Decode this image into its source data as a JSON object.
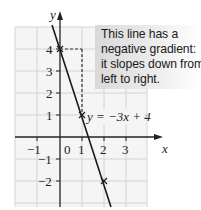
{
  "diagram": {
    "axes": {
      "x_label": "x",
      "y_label": "y",
      "x_ticks": [
        "−1",
        "0",
        "1",
        "2",
        "3"
      ],
      "y_ticks": [
        "4",
        "3",
        "2",
        "1",
        "−1",
        "−2"
      ]
    },
    "line_label": "y = −3x + 4",
    "points": [
      {
        "x": 0,
        "y": 4,
        "marker": "cross"
      },
      {
        "x": 1,
        "y": 1,
        "marker": "cross"
      },
      {
        "x": 2,
        "y": -2,
        "marker": "cross"
      }
    ],
    "callout": {
      "lines": [
        "This line has a",
        "negative gradient:",
        "it slopes down from",
        "left to right."
      ]
    },
    "colors": {
      "grid": "#d6d6d6",
      "grid_background": "#f4f4f4",
      "axis": "#222222",
      "line": "#1a1a1a",
      "guide_dashed": "#333333",
      "callout_bg": "#d9d9d9"
    }
  }
}
